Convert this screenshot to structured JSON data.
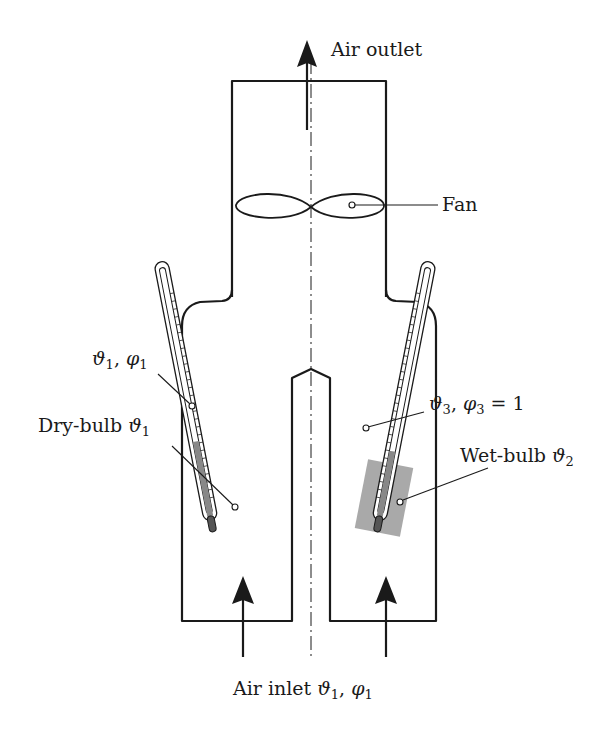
{
  "diagram": {
    "colors": {
      "stroke": "#1a1a1a",
      "wick": "#a9a9a9",
      "background": "#ffffff"
    },
    "labels": {
      "air_outlet": "Air outlet",
      "fan": "Fan",
      "state_1": {
        "sym_t": "ϑ",
        "sub_t": "1",
        "sep": ", ",
        "sym_p": "φ",
        "sub_p": "1"
      },
      "dry_bulb": {
        "text": "Dry-bulb ",
        "sym": "ϑ",
        "sub": "1"
      },
      "state_3": {
        "sym_t": "ϑ",
        "sub_t": "3",
        "sep": ", ",
        "sym_p": "φ",
        "sub_p": "3",
        "tail": " = 1"
      },
      "wet_bulb": {
        "text": "Wet-bulb ",
        "sym": "ϑ",
        "sub": "2"
      },
      "air_inlet": {
        "text": "Air inlet ",
        "sym_t": "ϑ",
        "sub_t": "1",
        "sep": ", ",
        "sym_p": "φ",
        "sub_p": "1"
      }
    },
    "components": [
      "outlet-duct",
      "fan",
      "dry-bulb-thermometer",
      "wet-bulb-thermometer",
      "wet-wick",
      "left-inlet-channel",
      "right-inlet-channel",
      "center-partition",
      "symmetry-axis"
    ]
  }
}
